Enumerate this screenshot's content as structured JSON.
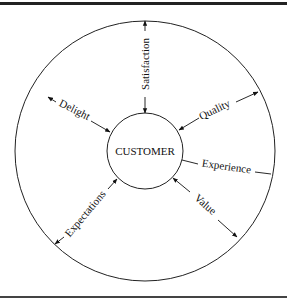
{
  "diagram": {
    "center_label": "CUSTOMER",
    "spokes": [
      {
        "label": "Satisfaction"
      },
      {
        "label": "Quality"
      },
      {
        "label": "Experience"
      },
      {
        "label": "Value"
      },
      {
        "label": "Expectations"
      },
      {
        "label": "Delight"
      }
    ]
  }
}
